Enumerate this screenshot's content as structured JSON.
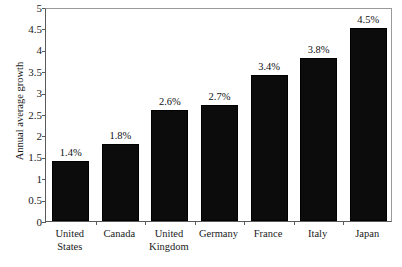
{
  "chart_data": {
    "type": "bar",
    "title": "",
    "xlabel": "",
    "ylabel": "Annual average growth",
    "categories": [
      "United States",
      "Canada",
      "United Kingdom",
      "Germany",
      "France",
      "Italy",
      "Japan"
    ],
    "category_lines": [
      [
        "United",
        "States"
      ],
      [
        "Canada"
      ],
      [
        "United",
        "Kingdom"
      ],
      [
        "Germany"
      ],
      [
        "France"
      ],
      [
        "Italy"
      ],
      [
        "Japan"
      ]
    ],
    "values": [
      1.4,
      1.8,
      2.6,
      2.7,
      3.4,
      3.8,
      4.5
    ],
    "data_labels": [
      "1.4%",
      "1.8%",
      "2.6%",
      "2.7%",
      "3.4%",
      "3.8%",
      "4.5%"
    ],
    "ylim": [
      0,
      5
    ],
    "ytick_values": [
      0,
      0.5,
      1,
      1.5,
      2,
      2.5,
      3,
      3.5,
      4,
      4.5,
      5
    ],
    "ytick_labels": [
      "0",
      "0.5",
      "1",
      "1.5",
      "2",
      "2.5",
      "3",
      "3.5",
      "4",
      "4.5",
      "5"
    ],
    "grid": false,
    "legend": false,
    "legend_position": "none",
    "bar_color": "#0c0c0c",
    "axis_color": "#5a5a5a",
    "background_color": "#ffffff"
  }
}
